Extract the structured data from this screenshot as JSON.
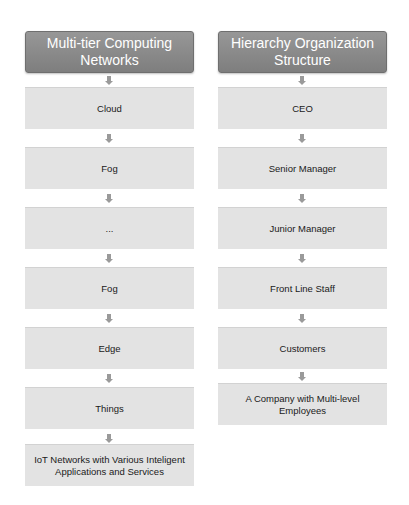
{
  "left": {
    "header": "Multi-tier Computing Networks",
    "items": [
      "Cloud",
      "Fog",
      "...",
      "Fog",
      "Edge",
      "Things",
      "IoT Networks with Various Inteligent Applications and Services"
    ]
  },
  "right": {
    "header": "Hierarchy Organization Structure",
    "items": [
      "CEO",
      "Senior Manager",
      "Junior Manager",
      "Front Line Staff",
      "Customers",
      "A Company with Multi-level Employees"
    ]
  },
  "icons": {
    "connector": "down-arrow-icon"
  },
  "colors": {
    "header_bg": "#888888",
    "box_bg": "#e3e3e3",
    "arrow": "#9a9a9a"
  }
}
